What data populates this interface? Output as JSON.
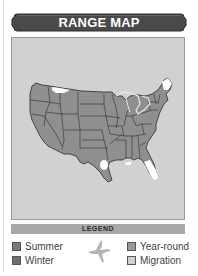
{
  "header": {
    "title": "RANGE MAP"
  },
  "map": {
    "region": "contiguous-united-states",
    "base_color": "#8f8f8f",
    "background_color": "#d1d1d1",
    "highlight_color": "#ffffff"
  },
  "legend": {
    "title": "LEGEND",
    "items": [
      {
        "label": "Summer",
        "color": "#7a7a7a"
      },
      {
        "label": "Winter",
        "color": "#6e6e6e"
      },
      {
        "label": "Year-round",
        "color": "#999999"
      },
      {
        "label": "Migration",
        "color": "#cfcfcf"
      }
    ],
    "bird_icon": "bird-silhouette-icon"
  }
}
